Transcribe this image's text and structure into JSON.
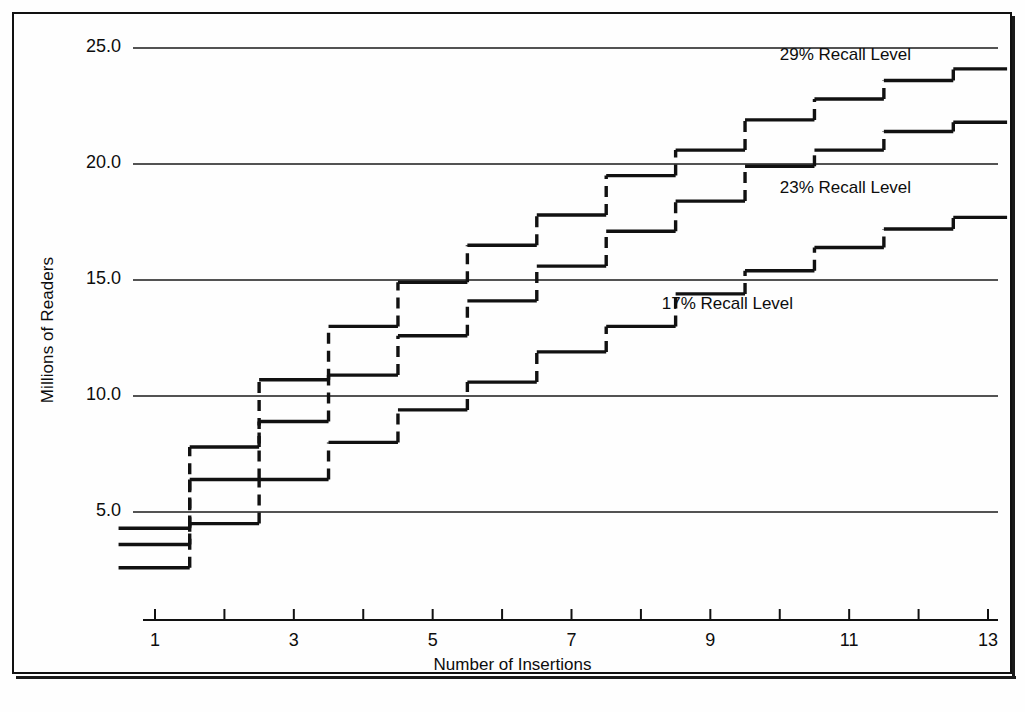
{
  "chart_data": {
    "type": "line",
    "subtype": "step",
    "title": "",
    "xlabel": "Number of Insertions",
    "ylabel": "Millions of Readers",
    "xlim": [
      0.6,
      13.4
    ],
    "ylim": [
      0.0,
      26.6
    ],
    "xticks": [
      1,
      2,
      3,
      4,
      5,
      6,
      7,
      8,
      9,
      10,
      11,
      12,
      13
    ],
    "xtick_labels": [
      "1",
      "",
      "3",
      "",
      "5",
      "",
      "7",
      "",
      "9",
      "",
      "11",
      "",
      "13"
    ],
    "yticks": [
      5.0,
      10.0,
      15.0,
      20.0,
      25.0
    ],
    "ytick_labels": [
      "5.0",
      "10.0",
      "15.0",
      "20.0",
      "25.0"
    ],
    "grid": "horizontal",
    "legend": "inline-annotations",
    "x": [
      1,
      2,
      3,
      4,
      5,
      6,
      7,
      8,
      9,
      10,
      11,
      12,
      13
    ],
    "series": [
      {
        "name": "29% Recall Level",
        "label": "29% Recall Level",
        "annotation_x": 10.0,
        "annotation_y": 24.6,
        "values": [
          4.3,
          7.8,
          10.7,
          13.0,
          14.9,
          16.5,
          17.8,
          19.5,
          20.6,
          21.9,
          22.8,
          23.6,
          24.1
        ]
      },
      {
        "name": "23% Recall Level",
        "label": "23% Recall Level",
        "annotation_x": 10.0,
        "annotation_y": 18.9,
        "values": [
          3.6,
          6.4,
          8.9,
          10.9,
          12.6,
          14.1,
          15.6,
          17.1,
          18.4,
          19.9,
          20.6,
          21.4,
          21.8
        ]
      },
      {
        "name": "17% Recall Level",
        "label": "17% Recall Level",
        "annotation_x": 8.3,
        "annotation_y": 13.9,
        "values": [
          2.6,
          4.5,
          6.4,
          8.0,
          9.4,
          10.6,
          11.9,
          13.0,
          14.4,
          15.4,
          16.4,
          17.2,
          17.7
        ]
      }
    ]
  },
  "axes": {
    "y_title": "Millions of Readers",
    "x_title": "Number of Insertions"
  },
  "colors": {
    "ink": "#111111",
    "grid": "#1a1a1a",
    "paper": "#fefefe"
  }
}
